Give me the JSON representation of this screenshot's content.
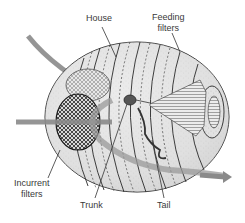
{
  "diagram": {
    "labels": {
      "house": "House",
      "feeding_filters_line1": "Feeding",
      "feeding_filters_line2": "filters",
      "incurrent_filters_line1": "Incurrent",
      "incurrent_filters_line2": "filters",
      "trunk": "Trunk",
      "tail": "Tail"
    },
    "colors": {
      "arrow": "#8a8a8a",
      "house_fill": "#e4e4e4",
      "outline": "#2a2a2a",
      "label_text": "#3a3a3a"
    },
    "flow_arrows": [
      "incoming-top-arrow",
      "incoming-left-arrow",
      "outgoing-right-arrow"
    ]
  }
}
